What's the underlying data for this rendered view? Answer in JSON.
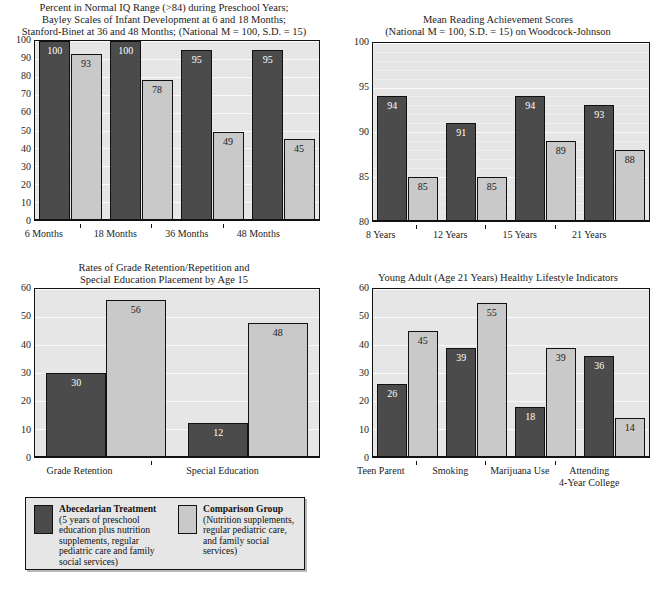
{
  "figure": {
    "legend": {
      "series": [
        {
          "key": "treatment",
          "title": "Abecedarian Treatment",
          "desc": "(5 years of preschool\neducation plus nutrition\nsupplements, regular\npediatric care and family\nsocial services)",
          "color": "#4b4b4b"
        },
        {
          "key": "comparison",
          "title": "Comparison Group",
          "desc": "(Nutrition supplements,\nregular pediatric care,\nand family social\nservices)",
          "color": "#c9c9c9"
        }
      ]
    }
  },
  "chart_data": [
    {
      "id": "iq-preschool",
      "type": "bar",
      "title": "Percent in Normal IQ Range (>84) during Preschool Years;\nBayley Scales of Infant Development at 6 and 18 Months;\nStanford-Binet at 36 and 48 Months; (National M = 100, S.D. = 15)",
      "xlabel": "",
      "ylabel": "",
      "ylim": [
        0,
        100
      ],
      "yticks": [
        0,
        10,
        20,
        30,
        40,
        50,
        60,
        70,
        80,
        90,
        100
      ],
      "grid": true,
      "legend_position": "external-bottom",
      "categories": [
        "6 Months",
        "18 Months",
        "36 Months",
        "48 Months"
      ],
      "series": [
        {
          "name": "Abecedarian Treatment",
          "color": "#4b4b4b",
          "values": [
            100,
            100,
            95,
            95
          ]
        },
        {
          "name": "Comparison Group",
          "color": "#c9c9c9",
          "values": [
            93,
            78,
            49,
            45
          ]
        }
      ]
    },
    {
      "id": "reading-achievement",
      "type": "bar",
      "title": "Mean Reading Achievement Scores\n(National M = 100, S.D. = 15) on Woodcock-Johnson",
      "xlabel": "",
      "ylabel": "",
      "ylim": [
        80,
        100
      ],
      "yticks": [
        80,
        85,
        90,
        95,
        100
      ],
      "grid": true,
      "legend_position": "external-bottom",
      "categories": [
        "8 Years",
        "12 Years",
        "15 Years",
        "21 Years"
      ],
      "series": [
        {
          "name": "Abecedarian Treatment",
          "color": "#4b4b4b",
          "values": [
            94,
            91,
            94,
            93
          ]
        },
        {
          "name": "Comparison Group",
          "color": "#c9c9c9",
          "values": [
            85,
            85,
            89,
            88
          ]
        }
      ]
    },
    {
      "id": "grade-retention",
      "type": "bar",
      "title": "Rates of Grade Retention/Repetition and\nSpecial Education Placement by Age 15",
      "xlabel": "",
      "ylabel": "",
      "ylim": [
        0,
        60
      ],
      "yticks": [
        0,
        10,
        20,
        30,
        40,
        50,
        60
      ],
      "grid": true,
      "legend_position": "external-bottom",
      "categories": [
        "Grade Retention",
        "Special Education"
      ],
      "series": [
        {
          "name": "Abecedarian Treatment",
          "color": "#4b4b4b",
          "values": [
            30,
            12
          ]
        },
        {
          "name": "Comparison Group",
          "color": "#c9c9c9",
          "values": [
            56,
            48
          ]
        }
      ]
    },
    {
      "id": "healthy-lifestyle",
      "type": "bar",
      "title": "Young Adult (Age 21 Years) Healthy Lifestyle Indicators",
      "xlabel": "",
      "ylabel": "",
      "ylim": [
        0,
        60
      ],
      "yticks": [
        0,
        10,
        20,
        30,
        40,
        50,
        60
      ],
      "grid": true,
      "legend_position": "external-bottom",
      "categories": [
        "Teen Parent",
        "Smoking",
        "Marijuana Use",
        "Attending\n4-Year College"
      ],
      "series": [
        {
          "name": "Abecedarian Treatment",
          "color": "#4b4b4b",
          "values": [
            26,
            39,
            18,
            36
          ]
        },
        {
          "name": "Comparison Group",
          "color": "#c9c9c9",
          "values": [
            45,
            55,
            39,
            14
          ]
        }
      ]
    }
  ]
}
